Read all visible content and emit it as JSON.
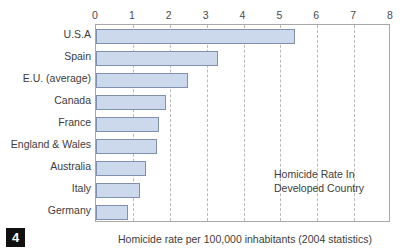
{
  "figure": {
    "number": "4",
    "caption": "Homicide rate per 100,000 inhabitants (2004 statistics)",
    "annotation_line1": "Homicide Rate In",
    "annotation_line2": "Developed Country"
  },
  "chart_data": {
    "type": "bar",
    "orientation": "horizontal",
    "title": "Homicide Rate In Developed Country",
    "xlabel": "Homicide rate per 100,000 inhabitants (2004 statistics)",
    "ylabel": "",
    "xlim": [
      0,
      8
    ],
    "xticks": [
      0,
      1,
      2,
      3,
      4,
      5,
      6,
      7,
      8
    ],
    "xtick_labels": [
      "0",
      "1",
      "2",
      "3",
      "4",
      "5",
      "6",
      "7",
      "8"
    ],
    "grid": "vertical-dashed",
    "legend": "none",
    "bar_fill": "#ccd9ec",
    "bar_stroke": "#8090b0",
    "categories": [
      "U.S.A",
      "Spain",
      "E.U. (average)",
      "Canada",
      "France",
      "England & Wales",
      "Australia",
      "Italy",
      "Germany"
    ],
    "values": [
      5.4,
      3.3,
      2.5,
      1.9,
      1.7,
      1.65,
      1.35,
      1.2,
      0.88
    ]
  }
}
